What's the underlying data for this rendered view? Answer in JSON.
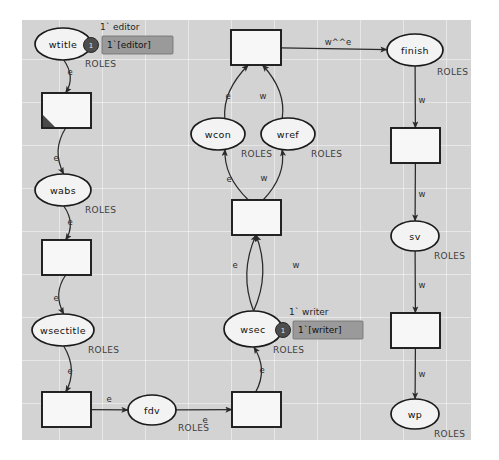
{
  "diagram": {
    "canvas_color": "#d3d3d3",
    "places": [
      {
        "id": "wtitle",
        "label": "wtitle",
        "type": "ROLES",
        "cx": 63,
        "cy": 44,
        "rx": 28,
        "ry": 16
      },
      {
        "id": "wabs",
        "label": "wabs",
        "type": "ROLES",
        "cx": 63,
        "cy": 190,
        "rx": 28,
        "ry": 16
      },
      {
        "id": "wsectitle",
        "label": "wsectitle",
        "type": "ROLES",
        "cx": 63,
        "cy": 330,
        "rx": 31,
        "ry": 16
      },
      {
        "id": "fdv",
        "label": "fdv",
        "type": "ROLES",
        "cx": 152,
        "cy": 410,
        "rx": 24,
        "ry": 15
      },
      {
        "id": "wcon",
        "label": "wcon",
        "type": "ROLES",
        "cx": 218,
        "cy": 134,
        "rx": 27,
        "ry": 16
      },
      {
        "id": "wref",
        "label": "wref",
        "type": "ROLES",
        "cx": 288,
        "cy": 134,
        "rx": 27,
        "ry": 16
      },
      {
        "id": "wsec",
        "label": "wsec",
        "type": "ROLES",
        "cx": 253,
        "cy": 329,
        "rx": 29,
        "ry": 18
      },
      {
        "id": "finish",
        "label": "finish",
        "type": "ROLES",
        "cx": 415,
        "cy": 50,
        "rx": 28,
        "ry": 16
      },
      {
        "id": "sv",
        "label": "sv",
        "type": "ROLES",
        "cx": 415,
        "cy": 236,
        "rx": 24,
        "ry": 15
      },
      {
        "id": "wp",
        "label": "wp",
        "type": "ROLES",
        "cx": 415,
        "cy": 414,
        "rx": 24,
        "ry": 15
      }
    ],
    "transitions": [
      {
        "id": "t1",
        "x": 42,
        "y": 93,
        "w": 49,
        "h": 35,
        "selected": true
      },
      {
        "id": "t2",
        "x": 42,
        "y": 240,
        "w": 49,
        "h": 35,
        "selected": false
      },
      {
        "id": "t3",
        "x": 42,
        "y": 392,
        "w": 49,
        "h": 35,
        "selected": false
      },
      {
        "id": "t4",
        "x": 232,
        "y": 392,
        "w": 49,
        "h": 35,
        "selected": false
      },
      {
        "id": "t5",
        "x": 232,
        "y": 200,
        "w": 49,
        "h": 35,
        "selected": false
      },
      {
        "id": "t6",
        "x": 231,
        "y": 30,
        "w": 50,
        "h": 35,
        "selected": false
      },
      {
        "id": "t7",
        "x": 391,
        "y": 128,
        "w": 49,
        "h": 35,
        "selected": false
      },
      {
        "id": "t8",
        "x": 391,
        "y": 313,
        "w": 49,
        "h": 35,
        "selected": false
      }
    ],
    "arcs": [
      {
        "id": "a1",
        "from": "wtitle",
        "to": "t1",
        "label": "e",
        "lx": 70,
        "ly": 72
      },
      {
        "id": "a2",
        "from": "t1",
        "to": "wabs",
        "label": "e",
        "lx": 56,
        "ly": 158
      },
      {
        "id": "a3",
        "from": "wabs",
        "to": "t2",
        "label": "e",
        "lx": 70,
        "ly": 222
      },
      {
        "id": "a4",
        "from": "t2",
        "to": "wsectitle",
        "label": "e",
        "lx": 56,
        "ly": 298
      },
      {
        "id": "a5",
        "from": "wsectitle",
        "to": "t3",
        "label": "e",
        "lx": 70,
        "ly": 371
      },
      {
        "id": "a6",
        "from": "t3",
        "to": "fdv",
        "label": "e",
        "lx": 109,
        "ly": 399
      },
      {
        "id": "a7",
        "from": "fdv",
        "to": "t4",
        "label": "e",
        "lx": 205,
        "ly": 420
      },
      {
        "id": "a8",
        "from": "t4",
        "to": "wsec",
        "label": "e",
        "lx": 262,
        "ly": 370
      },
      {
        "id": "a9",
        "from": "wsec",
        "to": "t5",
        "label": "e",
        "lx": 235,
        "ly": 265
      },
      {
        "id": "a10",
        "from": "wsec",
        "to": "t5",
        "label": "w",
        "lx": 296,
        "ly": 265
      },
      {
        "id": "a11",
        "from": "t5",
        "to": "wcon",
        "label": "e",
        "lx": 229,
        "ly": 179
      },
      {
        "id": "a12",
        "from": "t5",
        "to": "wref",
        "label": "w",
        "lx": 264,
        "ly": 178
      },
      {
        "id": "a13",
        "from": "wcon",
        "to": "t6",
        "label": "e",
        "lx": 228,
        "ly": 96
      },
      {
        "id": "a14",
        "from": "wref",
        "to": "t6",
        "label": "w",
        "lx": 263,
        "ly": 96
      },
      {
        "id": "a15",
        "from": "t6",
        "to": "finish",
        "label": "w^^e",
        "lx": 338,
        "ly": 42
      },
      {
        "id": "a16",
        "from": "finish",
        "to": "t7",
        "label": "w",
        "lx": 422,
        "ly": 100
      },
      {
        "id": "a17",
        "from": "t7",
        "to": "sv",
        "label": "w",
        "lx": 422,
        "ly": 194
      },
      {
        "id": "a18",
        "from": "sv",
        "to": "t8",
        "label": "w",
        "lx": 422,
        "ly": 285
      },
      {
        "id": "a19",
        "from": "t8",
        "to": "wp",
        "label": "w",
        "lx": 422,
        "ly": 374
      }
    ],
    "markings": [
      {
        "id": "m_wtitle",
        "place": "wtitle",
        "initial_expression": "1` editor",
        "token_count": "1",
        "marking_text": "1`[editor]",
        "token_cx": 91,
        "token_cy": 45,
        "init_x": 100,
        "init_y": 27,
        "box_x": 102,
        "box_y": 36,
        "box_w": 71,
        "box_h": 18,
        "text_x": 107,
        "text_y": 45
      },
      {
        "id": "m_wsec",
        "place": "wsec",
        "initial_expression": "1` writer",
        "token_count": "1",
        "marking_text": "1`[writer]",
        "token_cx": 283,
        "token_cy": 330,
        "init_x": 289,
        "init_y": 312,
        "box_x": 293,
        "box_y": 321,
        "box_w": 70,
        "box_h": 18,
        "text_x": 298,
        "text_y": 330
      }
    ],
    "type_labels": [
      {
        "for": "wtitle",
        "text": "ROLES",
        "x": 85,
        "y": 64
      },
      {
        "for": "wabs",
        "text": "ROLES",
        "x": 85,
        "y": 210
      },
      {
        "for": "wsectitle",
        "text": "ROLES",
        "x": 88,
        "y": 350
      },
      {
        "for": "fdv",
        "text": "ROLES",
        "x": 178,
        "y": 428
      },
      {
        "for": "wcon",
        "text": "ROLES",
        "x": 241,
        "y": 154
      },
      {
        "for": "wref",
        "text": "ROLES",
        "x": 311,
        "y": 154
      },
      {
        "for": "wsec",
        "text": "ROLES",
        "x": 273,
        "y": 350
      },
      {
        "for": "finish",
        "text": "ROLES",
        "x": 437,
        "y": 72
      },
      {
        "for": "sv",
        "text": "ROLES",
        "x": 434,
        "y": 256
      },
      {
        "for": "wp",
        "text": "ROLES",
        "x": 434,
        "y": 434
      }
    ]
  }
}
